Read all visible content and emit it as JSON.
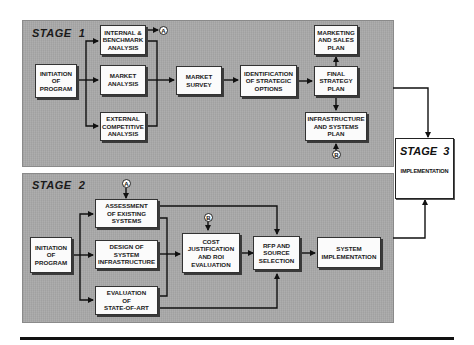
{
  "stage1": {
    "label": "STAGE  1",
    "boxes": {
      "initiation": "INITIATION\nOF\nPROGRAM",
      "internal": "INTERNAL &\nBENCHMARK\nANALYSIS",
      "market_analysis": "MARKET\nANALYSIS",
      "external": "EXTERNAL\nCOMPETITIVE\nANALYSIS",
      "market_survey": "MARKET\nSURVEY",
      "identification": "IDENTIFICATION\nOF STRATEGIC\nOPTIONS",
      "final_strategy": "FINAL\nSTRATEGY\nPLAN",
      "marketing_sales": "MARKETING\nAND SALES\nPLAN",
      "infrastructure": "INFRASTRUCTURE\nAND SYSTEMS\nPLAN"
    },
    "markers": {
      "a_out": "A",
      "b_in": "B"
    }
  },
  "stage2": {
    "label": "STAGE  2",
    "boxes": {
      "initiation": "INITIATION\nOF\nPROGRAM",
      "assessment": "ASSESSMENT\nOF EXISTING\nSYSTEMS",
      "design": "DESIGN OF\nSYSTEM\nINFRASTRUCTURE",
      "evaluation": "EVALUATION\nOF\nSTATE-OF-ART",
      "cost": "COST\nJUSTIFICATION\nAND ROI\nEVALUATION",
      "rfp": "RFP AND\nSOURCE\nSELECTION",
      "system_impl": "SYSTEM\nIMPLEMENTATION"
    },
    "markers": {
      "a_in": "A",
      "b_in": "B"
    }
  },
  "stage3": {
    "label": "STAGE  3",
    "sublabel": "IMPLEMENTATION"
  },
  "colors": {
    "panel": "#a9a9a9",
    "box": "#fbfbfb",
    "line": "#111111"
  }
}
